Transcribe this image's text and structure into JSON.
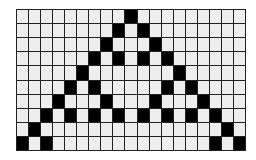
{
  "diagram": {
    "type": "cellular-automaton-grid",
    "rule": "Rule 90",
    "cols": 19,
    "rows": 10,
    "colors": {
      "on": "#000000",
      "off": "#eeeeee",
      "grid_line": "#222222"
    },
    "cells_on": [
      [
        9
      ],
      [
        8,
        10
      ],
      [
        7,
        11
      ],
      [
        6,
        8,
        10,
        12
      ],
      [
        5,
        13
      ],
      [
        4,
        6,
        12,
        14
      ],
      [
        3,
        7,
        11,
        15
      ],
      [
        2,
        4,
        6,
        8,
        10,
        12,
        14,
        16
      ],
      [
        1,
        17
      ],
      [
        0,
        2,
        16,
        18
      ]
    ]
  }
}
